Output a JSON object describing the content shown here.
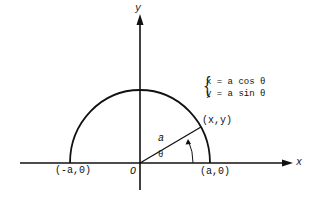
{
  "diagram": {
    "type": "semicircle-parametric",
    "axes": {
      "x_label": "x",
      "y_label": "y",
      "origin_label": "O"
    },
    "points": [
      {
        "label": "(-a,0)"
      },
      {
        "label": "(a,0)"
      },
      {
        "label": "(x,y)"
      }
    ],
    "radius_label": "a",
    "angle_label": "θ",
    "equations": [
      "x = a cos θ",
      "y = a sin θ"
    ]
  }
}
